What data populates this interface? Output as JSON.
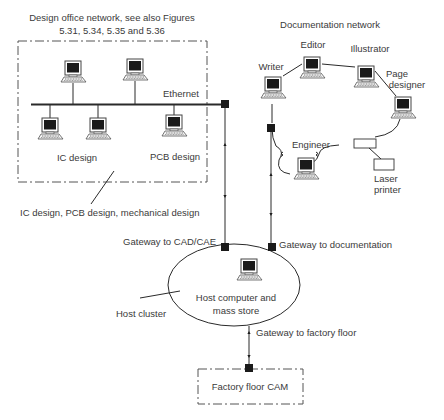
{
  "diagram": {
    "type": "network-architecture",
    "design_office": {
      "title_line1": "Design office network, see also Figures",
      "title_line2": "5.31, 5.34, 5.35 and 5.36",
      "bus_label": "Ethernet",
      "ic_label": "IC design",
      "pcb_label": "PCB design",
      "callout": "IC design, PCB design, mechanical design",
      "workstation_count": 5
    },
    "documentation": {
      "title": "Documentation network",
      "nodes": [
        {
          "id": "writer",
          "label": "Writer"
        },
        {
          "id": "editor",
          "label": "Editor"
        },
        {
          "id": "illustrator",
          "label": "Illustrator"
        },
        {
          "id": "page_designer",
          "label_line1": "Page",
          "label_line2": "designer"
        },
        {
          "id": "engineer",
          "label": "Engineer"
        }
      ],
      "printer_label_line1": "Laser",
      "printer_label_line2": "printer"
    },
    "host": {
      "gateway_cad": "Gateway to CAD/CAE",
      "gateway_doc": "Gateway to documentation",
      "host_line1": "Host computer and",
      "host_line2": "mass store",
      "cluster_label": "Host cluster",
      "gateway_factory": "Gateway to factory floor"
    },
    "factory": {
      "label": "Factory floor CAM"
    },
    "colors": {
      "line": "#2a2a2a",
      "text": "#3a3a3a",
      "screen": "#1a1a1a",
      "background": "#ffffff"
    }
  }
}
